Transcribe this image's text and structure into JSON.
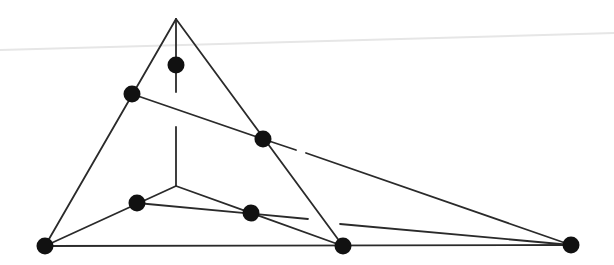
{
  "diagram": {
    "type": "graph",
    "colors": {
      "background": "#ffffff",
      "edge": "#2a2a2a",
      "node": "#111111",
      "scan_line": "#e6e6e6"
    },
    "stroke_width": 1.8,
    "node_radius": 8.5,
    "vertices": {
      "apex": [
        176,
        19
      ],
      "inner_center": [
        176,
        186
      ]
    },
    "nodes": [
      {
        "id": "top-inner",
        "x": 176,
        "y": 65
      },
      {
        "id": "left-edge",
        "x": 132,
        "y": 94
      },
      {
        "id": "right-edge",
        "x": 263,
        "y": 139
      },
      {
        "id": "inner-left",
        "x": 137,
        "y": 203
      },
      {
        "id": "inner-middle",
        "x": 251,
        "y": 213
      },
      {
        "id": "bottom-left",
        "x": 45,
        "y": 246
      },
      {
        "id": "bottom-middle",
        "x": 343,
        "y": 246
      },
      {
        "id": "bottom-right",
        "x": 571,
        "y": 245
      }
    ],
    "edges": [
      {
        "id": "apex-to-bottom-left",
        "x1": 176,
        "y1": 19,
        "x2": 45,
        "y2": 246
      },
      {
        "id": "apex-to-bottom-middle",
        "x1": 176,
        "y1": 19,
        "x2": 343,
        "y2": 246
      },
      {
        "id": "bottom-base",
        "x1": 45,
        "y1": 246,
        "x2": 571,
        "y2": 245
      },
      {
        "id": "apex-vertical-upper",
        "x1": 176,
        "y1": 19,
        "x2": 176,
        "y2": 92
      },
      {
        "id": "apex-vertical-lower",
        "x1": 176,
        "y1": 127,
        "x2": 176,
        "y2": 186
      },
      {
        "id": "inner-center-to-bottom-left",
        "x1": 176,
        "y1": 186,
        "x2": 45,
        "y2": 246
      },
      {
        "id": "inner-center-to-bottom-middle",
        "x1": 176,
        "y1": 186,
        "x2": 343,
        "y2": 246
      },
      {
        "id": "left-edge-to-right-edge",
        "x1": 132,
        "y1": 94,
        "x2": 263,
        "y2": 139
      },
      {
        "id": "right-edge-to-bottom-right-a",
        "x1": 263,
        "y1": 139,
        "x2": 296,
        "y2": 150
      },
      {
        "id": "right-edge-to-bottom-right-b",
        "x1": 306,
        "y1": 153,
        "x2": 571,
        "y2": 245
      },
      {
        "id": "inner-left-to-gap",
        "x1": 137,
        "y1": 203,
        "x2": 308,
        "y2": 219
      },
      {
        "id": "gap-to-bottom-right",
        "x1": 340,
        "y1": 224,
        "x2": 571,
        "y2": 245
      }
    ],
    "scan_line": {
      "x1": 0,
      "y1": 50,
      "x2": 614,
      "y2": 33
    }
  }
}
